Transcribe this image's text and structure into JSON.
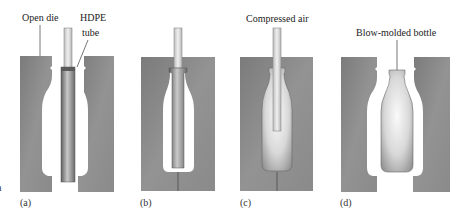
{
  "diagram": {
    "colors": {
      "die": "#8a8a8a",
      "die_dark": "#747474",
      "die_light": "#a3a3a3",
      "tube_dark": "#6a6a6a",
      "tube_light": "#c8c8c8",
      "pipe": "#d9d9d9",
      "pipe_edge": "#7a7a7a",
      "bottle_light": "#f2f2f2",
      "bottle_dark": "#9a9a9a"
    },
    "panels": [
      {
        "id": "a",
        "label": "(a)",
        "annotations": [
          "Open die",
          "HDPE",
          "tube"
        ]
      },
      {
        "id": "b",
        "label": "(b)",
        "annotations": []
      },
      {
        "id": "c",
        "label": "(c)",
        "annotations": [
          "Compressed air"
        ]
      },
      {
        "id": "d",
        "label": "(d)",
        "annotations": [
          "Blow-molded bottle"
        ]
      }
    ],
    "stray_mark": "a"
  }
}
